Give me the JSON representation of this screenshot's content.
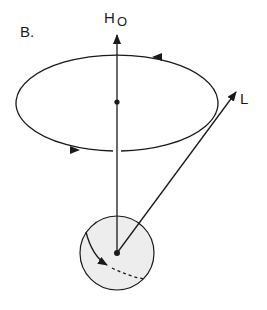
{
  "figure": {
    "panel_label": "B.",
    "field_label": {
      "main": "H",
      "subscript": "O"
    },
    "vector_label": "L"
  },
  "colors": {
    "stroke": "#1a1a1a",
    "sphere_fill": "#ededed",
    "background": "#ffffff"
  }
}
